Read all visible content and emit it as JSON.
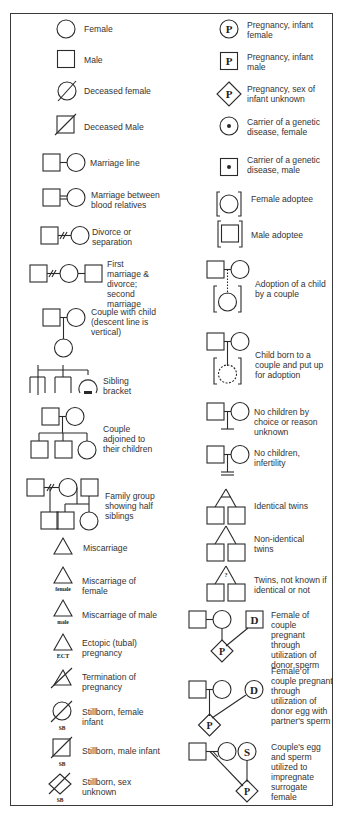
{
  "left_column": [
    {
      "id": "female",
      "label": "Female"
    },
    {
      "id": "male",
      "label": "Male"
    },
    {
      "id": "deceased_female",
      "label": "Deceased female"
    },
    {
      "id": "deceased_male",
      "label": "Deceased Male"
    },
    {
      "id": "marriage_line",
      "label": "Marriage line"
    },
    {
      "id": "marriage_blood",
      "label": "Marriage between blood relatives"
    },
    {
      "id": "divorce",
      "label": "Divorce or separation"
    },
    {
      "id": "first_marriage",
      "label": "First marriage & divorce; second marriage"
    },
    {
      "id": "couple_child",
      "label": "Couple with child (descent line is vertical)"
    },
    {
      "id": "sibling_bracket",
      "label": "Sibling bracket"
    },
    {
      "id": "couple_children",
      "label": "Couple adjoined to their children"
    },
    {
      "id": "half_siblings",
      "label": "Family group showing half siblings"
    },
    {
      "id": "miscarriage",
      "label": "Miscarriage"
    },
    {
      "id": "miscarriage_female",
      "label": "Miscarriage of female",
      "tag": "female"
    },
    {
      "id": "miscarriage_male",
      "label": "Miscarriage of male",
      "tag": "male"
    },
    {
      "id": "ectopic",
      "label": "Ectopic (tubal) pregnancy",
      "tag": "ECT"
    },
    {
      "id": "termination",
      "label": "Termination of pregnancy"
    },
    {
      "id": "stillborn_female",
      "label": "Stillborn, female infant",
      "tag": "SB"
    },
    {
      "id": "stillborn_male",
      "label": "Stillborn, male infant",
      "tag": "SB"
    },
    {
      "id": "stillborn_unknown",
      "label": "Stillborn, sex unknown",
      "tag": "SB"
    }
  ],
  "right_column": [
    {
      "id": "preg_female",
      "label": "Pregnancy, infant female",
      "glyph": "P"
    },
    {
      "id": "preg_male",
      "label": "Pregnancy, infant male",
      "glyph": "P"
    },
    {
      "id": "preg_unknown",
      "label": "Pregnancy, sex of infant unknown",
      "glyph": "P"
    },
    {
      "id": "carrier_female",
      "label": "Carrier of a genetic disease, female"
    },
    {
      "id": "carrier_male",
      "label": "Carrier of a genetic disease, male"
    },
    {
      "id": "female_adoptee",
      "label": "Female adoptee"
    },
    {
      "id": "male_adoptee",
      "label": "Male adoptee"
    },
    {
      "id": "adoption_couple",
      "label": "Adoption of a child by a couple"
    },
    {
      "id": "put_up_adoption",
      "label": "Child born to a couple and put up for adoption"
    },
    {
      "id": "no_children_choice",
      "label": "No children by choice or reason unknown"
    },
    {
      "id": "no_children_infertility",
      "label": "No children, infertility"
    },
    {
      "id": "identical_twins",
      "label": "Identical twins"
    },
    {
      "id": "nonidentical_twins",
      "label": "Non-identical twins"
    },
    {
      "id": "twins_unknown",
      "label": "Twins, not known if identical or not",
      "glyph": "?"
    },
    {
      "id": "donor_sperm",
      "label": "Female of couple pregnant through utilization of donor sperm",
      "glyph_donor": "D",
      "glyph_preg": "P"
    },
    {
      "id": "donor_egg",
      "label": "Female of couple pregnant through utilization of donor egg with partner's sperm",
      "glyph_donor": "D",
      "glyph_preg": "P"
    },
    {
      "id": "surrogate",
      "label": "Couple's egg and sperm utilized to impregnate surrogate female",
      "glyph_donor": "S",
      "glyph_preg": "P"
    }
  ]
}
